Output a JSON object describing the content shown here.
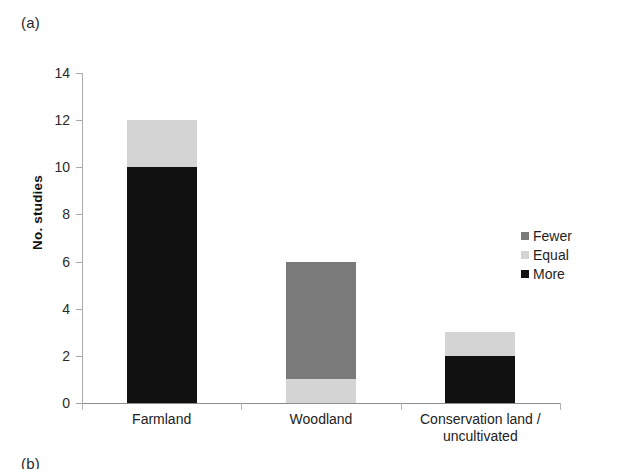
{
  "figure": {
    "panel_label": "(a)",
    "next_panel_label": "(b)"
  },
  "legend": {
    "position": "right",
    "items": [
      {
        "label": "Fewer",
        "color": "#7a7a7a"
      },
      {
        "label": "Equal",
        "color": "#d4d4d4"
      },
      {
        "label": "More",
        "color": "#111111"
      }
    ]
  },
  "chart_data": {
    "type": "bar",
    "stacked": true,
    "title": "",
    "subtitle": "",
    "xlabel": "",
    "ylabel": "No. studies",
    "ylim": [
      0,
      14
    ],
    "ytick_step": 2,
    "yticks": [
      0,
      2,
      4,
      6,
      8,
      10,
      12,
      14
    ],
    "ytick_labels": [
      "0",
      "2",
      "4",
      "6",
      "8",
      "10",
      "12",
      "14"
    ],
    "grid": false,
    "legend_position": "right",
    "legend_entries": [
      "Fewer",
      "Equal",
      "More"
    ],
    "categories": [
      "Farmland",
      "Woodland",
      "Conservation land / uncultivated"
    ],
    "category_label_lines": [
      [
        "Farmland"
      ],
      [
        "Woodland"
      ],
      [
        "Conservation land /",
        "uncultivated"
      ]
    ],
    "series": [
      {
        "name": "Fewer",
        "color": "#7a7a7a",
        "values": [
          0,
          5,
          0
        ]
      },
      {
        "name": "Equal",
        "color": "#d4d4d4",
        "values": [
          2,
          1,
          1
        ]
      },
      {
        "name": "More",
        "color": "#111111",
        "values": [
          10,
          0,
          2
        ]
      }
    ],
    "totals": [
      12,
      6,
      3
    ]
  }
}
